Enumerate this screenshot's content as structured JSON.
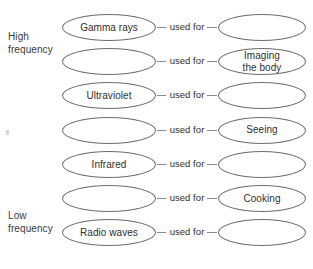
{
  "diagram": {
    "axis_labels": {
      "high": {
        "line1": "High",
        "line2": "frequency"
      },
      "low": {
        "line1": "Low",
        "line2": "frequency"
      }
    },
    "connector_label": "used for",
    "colors": {
      "stroke": "#6e6e6e",
      "connector": "#8a8a8a",
      "text": "#2f2f2f",
      "label_text": "#3a3a3a",
      "background": "#ffffff"
    },
    "rows": [
      {
        "source": "Gamma rays",
        "source_blank": false,
        "use_line1": "",
        "use_line2": "",
        "use_blank": true
      },
      {
        "source": "",
        "source_blank": true,
        "use_line1": "Imaging",
        "use_line2": "the body",
        "use_blank": false
      },
      {
        "source": "Ultraviolet",
        "source_blank": false,
        "use_line1": "",
        "use_line2": "",
        "use_blank": true
      },
      {
        "source": "",
        "source_blank": true,
        "use_line1": "Seeing",
        "use_line2": "",
        "use_blank": false
      },
      {
        "source": "Infrared",
        "source_blank": false,
        "use_line1": "",
        "use_line2": "",
        "use_blank": true
      },
      {
        "source": "",
        "source_blank": true,
        "use_line1": "Cooking",
        "use_line2": "",
        "use_blank": false
      },
      {
        "source": "Radio waves",
        "source_blank": false,
        "use_line1": "",
        "use_line2": "",
        "use_blank": true
      }
    ]
  }
}
